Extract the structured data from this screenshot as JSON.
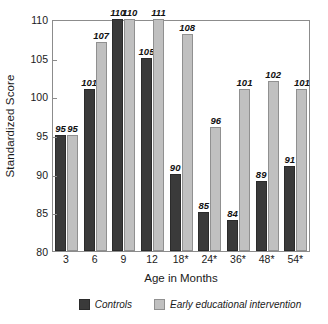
{
  "chart_data": {
    "type": "bar",
    "title": "",
    "xlabel": "Age in Months",
    "ylabel": "Standardized Score",
    "categories": [
      "3",
      "6",
      "9",
      "12",
      "18*",
      "24*",
      "36*",
      "48*",
      "54*"
    ],
    "series": [
      {
        "name": "Controls",
        "color": "#3a3a3a",
        "values": [
          95,
          101,
          110,
          105,
          90,
          85,
          84,
          89,
          91
        ]
      },
      {
        "name": "Early educational intervention",
        "color": "#c0c0c0",
        "values": [
          95,
          107,
          110,
          111,
          108,
          96,
          101,
          102,
          101
        ]
      }
    ],
    "ylim": [
      80,
      110
    ],
    "yticks": [
      80,
      85,
      90,
      95,
      100,
      105,
      110
    ],
    "grid": false,
    "legend_position": "bottom",
    "data_labels": true
  },
  "axes": {
    "y_title": "Standardized Score",
    "x_title": "Age in Months"
  },
  "legend": {
    "items": [
      {
        "label": "Controls",
        "color": "#3a3a3a"
      },
      {
        "label": "Early educational intervention",
        "color": "#c0c0c0"
      }
    ]
  }
}
